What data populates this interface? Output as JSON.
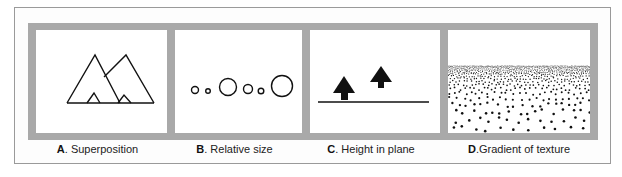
{
  "figure": {
    "panels": [
      {
        "id": "A",
        "letter": "A",
        "separator": ". ",
        "caption": "Superposition",
        "illustration": "two-overlapping-triangles"
      },
      {
        "id": "B",
        "letter": "B",
        "separator": ". ",
        "caption": "Relative size",
        "illustration": "circles-of-varying-size"
      },
      {
        "id": "C",
        "letter": "C",
        "separator": ". ",
        "caption": "Height in plane",
        "illustration": "two-trees-on-ground-line"
      },
      {
        "id": "D",
        "letter": "D",
        "separator": ".",
        "caption": "Gradient of texture",
        "illustration": "dot-texture-gradient"
      }
    ],
    "colors": {
      "frame": "#a9a9a9",
      "outer_border": "#9a9a9a",
      "ink": "#111111",
      "panel_bg": "#ffffff"
    }
  }
}
